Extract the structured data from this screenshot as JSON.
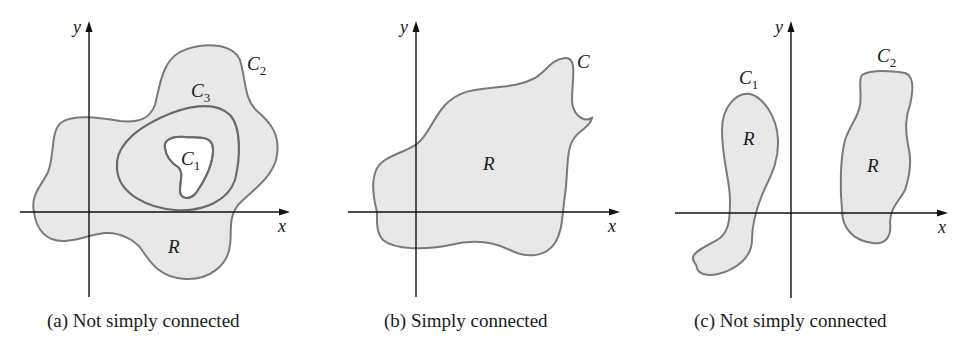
{
  "figure": {
    "panels": [
      {
        "id": "a",
        "caption": "(a) Not simply connected",
        "axes": {
          "x_label": "x",
          "y_label": "y"
        },
        "region_label": "R",
        "curves": [
          {
            "name": "C",
            "sub": "1",
            "role": "inner boundary (hole)"
          },
          {
            "name": "C",
            "sub": "2",
            "role": "outer boundary"
          },
          {
            "name": "C",
            "sub": "3",
            "role": "closed curve around hole"
          }
        ]
      },
      {
        "id": "b",
        "caption": "(b) Simply connected",
        "axes": {
          "x_label": "x",
          "y_label": "y"
        },
        "region_label": "R",
        "curves": [
          {
            "name": "C",
            "sub": "",
            "role": "boundary"
          }
        ]
      },
      {
        "id": "c",
        "caption": "(c) Not simply connected",
        "axes": {
          "x_label": "x",
          "y_label": "y"
        },
        "region_labels": [
          "R",
          "R"
        ],
        "curves": [
          {
            "name": "C",
            "sub": "1",
            "role": "left component boundary"
          },
          {
            "name": "C",
            "sub": "2",
            "role": "right component boundary"
          }
        ]
      }
    ],
    "colors": {
      "region_fill": "#e8e8e8",
      "boundary_stroke": "#7a7a7a",
      "axis": "#111111",
      "text": "#1a1a1a"
    }
  }
}
